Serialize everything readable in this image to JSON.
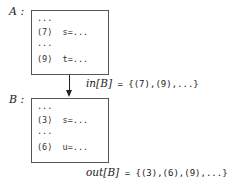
{
  "blocks": [
    {
      "name": "A",
      "label": "A :",
      "lines": [
        "...",
        "(7)  s=...",
        "...",
        "(9)  t=..."
      ]
    },
    {
      "name": "B",
      "label": "B :",
      "lines": [
        "...",
        "(3)  s=...",
        "...",
        "(6)  u=..."
      ]
    }
  ],
  "edge": {
    "from": "A",
    "to": "B"
  },
  "in_set": {
    "name": "in[B]",
    "value": " = {(7),(9),...}"
  },
  "out_set": {
    "name": "out[B]",
    "value": " = {(3),(6),(9),...}"
  }
}
